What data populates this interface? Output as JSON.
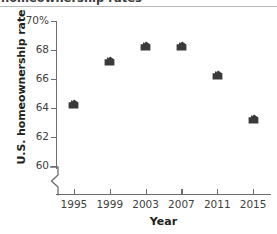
{
  "title": "homeownership rates",
  "axis_break_symbol": "zigzag-break",
  "colors": {
    "marker": "#3a3a3c",
    "axis": "#6e6e70",
    "text": "#231f20",
    "tick_text": "#3f3f41",
    "rule": "#b9b9bb",
    "background": "#ffffff"
  },
  "chart_data": {
    "type": "scatter",
    "title": "homeownership rates",
    "xlabel": "Year",
    "ylabel": "U.S. homeownership rate",
    "categories": [
      "1995",
      "1999",
      "2003",
      "2007",
      "2011",
      "2015"
    ],
    "x": [
      1995,
      1999,
      2003,
      2007,
      2011,
      2015
    ],
    "values": [
      64,
      67,
      68,
      68,
      66,
      63
    ],
    "ylim": [
      60,
      70
    ],
    "xlim": [
      1993,
      2017
    ],
    "yticks": [
      60,
      62,
      64,
      66,
      68,
      70
    ],
    "ytick_labels": [
      "60",
      "62",
      "64",
      "66",
      "68",
      "70%"
    ],
    "xticks": [
      1995,
      1999,
      2003,
      2007,
      2011,
      2015
    ],
    "xtick_labels": [
      "1995",
      "1999",
      "2003",
      "2007",
      "2011",
      "2015"
    ],
    "grid": false,
    "legend": null,
    "marker_style": "house",
    "axis_break": "y-axis below 60"
  }
}
